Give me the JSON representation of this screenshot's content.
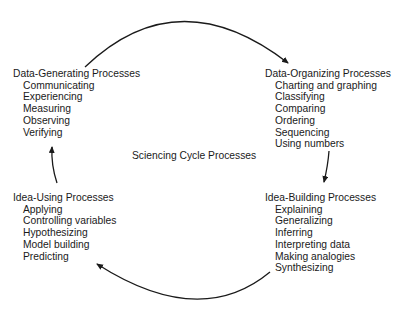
{
  "diagram": {
    "center_label": "Sciencing Cycle Processes",
    "groups": [
      {
        "id": "data-generating",
        "title": "Data-Generating Processes",
        "items": [
          "Communicating",
          "Experiencing",
          "Measuring",
          "Observing",
          "Verifying"
        ]
      },
      {
        "id": "data-organizing",
        "title": "Data-Organizing Processes",
        "items": [
          "Charting and graphing",
          "Classifying",
          "Comparing",
          "Ordering",
          "Sequencing",
          "Using numbers"
        ]
      },
      {
        "id": "idea-building",
        "title": "Idea-Building Processes",
        "items": [
          "Explaining",
          "Generalizing",
          "Inferring",
          "Interpreting data",
          "Making analogies",
          "Synthesizing"
        ]
      },
      {
        "id": "idea-using",
        "title": "Idea-Using Processes",
        "items": [
          "Applying",
          "Controlling variables",
          "Hypothesizing",
          "Model building",
          "Predicting"
        ]
      }
    ],
    "arrows": [
      {
        "from": "Data-Generating Processes",
        "to": "Data-Organizing Processes"
      },
      {
        "from": "Data-Organizing Processes",
        "to": "Idea-Building Processes"
      },
      {
        "from": "Idea-Building Processes",
        "to": "Idea-Using Processes"
      },
      {
        "from": "Idea-Using Processes",
        "to": "Data-Generating Processes"
      }
    ],
    "colors": {
      "line": "#1a1a1a",
      "background": "#ffffff"
    }
  }
}
